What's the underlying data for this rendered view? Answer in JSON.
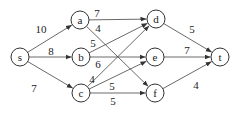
{
  "diagram": {
    "type": "directed-flow-network",
    "node_radius": 9,
    "colors": {
      "stroke": "#333333",
      "text": "#222222",
      "background": "#ffffff"
    },
    "nodes": [
      {
        "id": "s",
        "label": "s",
        "x": 20,
        "y": 57
      },
      {
        "id": "a",
        "label": "a",
        "x": 80,
        "y": 20
      },
      {
        "id": "b",
        "label": "b",
        "x": 81,
        "y": 57
      },
      {
        "id": "c",
        "label": "c",
        "x": 81,
        "y": 93
      },
      {
        "id": "d",
        "label": "d",
        "x": 156,
        "y": 19
      },
      {
        "id": "e",
        "label": "e",
        "x": 155,
        "y": 57
      },
      {
        "id": "f",
        "label": "f",
        "x": 155,
        "y": 93
      },
      {
        "id": "t",
        "label": "t",
        "x": 220,
        "y": 57
      }
    ],
    "edges": [
      {
        "from": "s",
        "to": "a",
        "label": "10",
        "lx": 41,
        "ly": 29
      },
      {
        "from": "s",
        "to": "b",
        "label": "8",
        "lx": 51,
        "ly": 51
      },
      {
        "from": "s",
        "to": "c",
        "label": "7",
        "lx": 34,
        "ly": 88
      },
      {
        "from": "a",
        "to": "d",
        "label": "7",
        "lx": 97,
        "ly": 13
      },
      {
        "from": "a",
        "to": "f",
        "label": "4",
        "lx": 98,
        "ly": 28
      },
      {
        "from": "b",
        "to": "d",
        "label": "5",
        "lx": 93,
        "ly": 43
      },
      {
        "from": "b",
        "to": "e",
        "label": "6",
        "lx": 98,
        "ly": 64
      },
      {
        "from": "c",
        "to": "d",
        "label": "4",
        "lx": 92,
        "ly": 79
      },
      {
        "from": "c",
        "to": "e",
        "label": "5",
        "lx": 112,
        "ly": 86
      },
      {
        "from": "c",
        "to": "f",
        "label": "5",
        "lx": 113,
        "ly": 101
      },
      {
        "from": "d",
        "to": "t",
        "label": "5",
        "lx": 192,
        "ly": 29
      },
      {
        "from": "e",
        "to": "t",
        "label": "7",
        "lx": 187,
        "ly": 50
      },
      {
        "from": "f",
        "to": "t",
        "label": "4",
        "lx": 196,
        "ly": 85
      }
    ]
  }
}
